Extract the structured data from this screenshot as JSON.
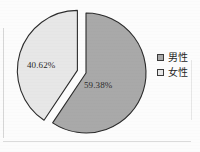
{
  "chart_data": {
    "type": "pie",
    "title": "",
    "subtitle": "",
    "xlabel": "",
    "ylabel": "",
    "legend_position": "right",
    "grid": false,
    "exploded": true,
    "categories": [
      "男性",
      "女性"
    ],
    "values": [
      59.38,
      40.62
    ],
    "value_unit": "%",
    "slices": [
      {
        "name": "男性",
        "value": 59.38,
        "label": "59.38%",
        "color": "#a9a9a9",
        "border_color": "#2b2b2b",
        "exploded": false,
        "start_angle_deg": 0,
        "sweep_deg": 213.77
      },
      {
        "name": "女性",
        "value": 40.62,
        "label": "40.62%",
        "color": "#e7e7e7",
        "border_color": "#2b2b2b",
        "exploded": true,
        "start_angle_deg": 213.77,
        "sweep_deg": 146.23
      }
    ],
    "data_labels": [
      "59.38%",
      "40.62%"
    ],
    "legend": [
      {
        "label": "男性",
        "color": "#a9a9a9"
      },
      {
        "label": "女性",
        "color": "#e7e7e7"
      }
    ]
  },
  "figure": {
    "background": "#fcfcfc",
    "outline_color": "#2b2b2b"
  }
}
